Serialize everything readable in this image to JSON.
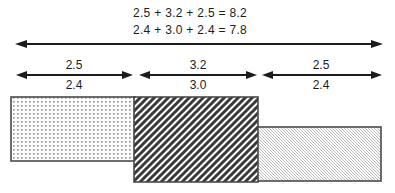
{
  "diagram": {
    "equations": {
      "line1": "2.5 + 3.2 + 2.5 = 8.2",
      "line2": "2.4 + 3.0 + 2.4 = 7.8"
    },
    "total_span": {
      "upper_total": "8.2",
      "lower_total": "7.8"
    },
    "segments": [
      {
        "upper": "2.5",
        "lower": "2.4",
        "pattern": "dot-grid"
      },
      {
        "upper": "3.2",
        "lower": "3.0",
        "pattern": "diagonal-stripes"
      },
      {
        "upper": "2.5",
        "lower": "2.4",
        "pattern": "fine-hatch"
      }
    ],
    "colors": {
      "line": "#1c1c1c",
      "rect_border": "#4a4a4a",
      "stripe": "#3a3a3a",
      "dot": "#9a9a9a",
      "fine_hatch": "#b2b2b2",
      "background": "#ffffff"
    }
  }
}
